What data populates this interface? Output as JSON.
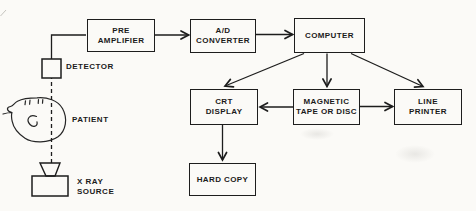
{
  "diagram": {
    "paper_color": "#fbfaf7",
    "ink_color": "#1d1d1d",
    "boxes": [
      {
        "id": "pre-amplifier",
        "label": "PRE\nAMPLIFIER"
      },
      {
        "id": "ad-converter",
        "label": "A/D\nCONVERTER"
      },
      {
        "id": "computer",
        "label": "COMPUTER"
      },
      {
        "id": "crt-display",
        "label": "CRT\nDISPLAY"
      },
      {
        "id": "magnetic-tape-or-disc",
        "label": "MAGNETIC\nTAPE OR DISC"
      },
      {
        "id": "line-printer",
        "label": "LINE\nPRINTER"
      },
      {
        "id": "hard-copy",
        "label": "HARD COPY"
      }
    ],
    "labels": {
      "detector": "DETECTOR",
      "patient": "PATIENT",
      "xray_source": "X RAY\nSOURCE"
    },
    "connections": [
      {
        "from": "X RAY SOURCE",
        "to": "DETECTOR",
        "style": "dashed beam through patient head"
      },
      {
        "from": "DETECTOR",
        "to": "PRE AMPLIFIER",
        "style": "plain line"
      },
      {
        "from": "PRE AMPLIFIER",
        "to": "A/D CONVERTER",
        "style": "arrow"
      },
      {
        "from": "A/D CONVERTER",
        "to": "COMPUTER",
        "style": "arrow"
      },
      {
        "from": "COMPUTER",
        "to": "CRT DISPLAY",
        "style": "arrow"
      },
      {
        "from": "COMPUTER",
        "to": "MAGNETIC TAPE OR DISC",
        "style": "arrow"
      },
      {
        "from": "COMPUTER",
        "to": "LINE PRINTER",
        "style": "arrow"
      },
      {
        "from": "MAGNETIC TAPE OR DISC",
        "to": "CRT DISPLAY",
        "style": "arrow"
      },
      {
        "from": "MAGNETIC TAPE OR DISC",
        "to": "LINE PRINTER",
        "style": "arrow"
      },
      {
        "from": "CRT DISPLAY",
        "to": "HARD COPY",
        "style": "arrow"
      }
    ]
  }
}
